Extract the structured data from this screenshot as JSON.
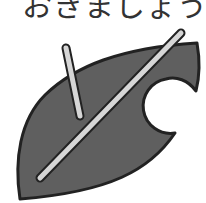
{
  "caption": {
    "text": "おきましょう。"
  },
  "illustration": {
    "icon": "bitten-leaf-icon",
    "fill_color": "#5f5f5f",
    "outline_color": "#222222",
    "vein_color": "#d6d6d6"
  }
}
